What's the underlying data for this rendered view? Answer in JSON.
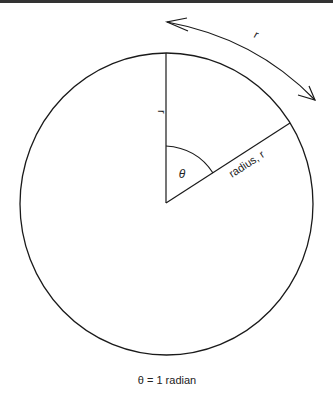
{
  "diagram": {
    "caption": "θ = 1 radian",
    "angle_label": "θ",
    "radius_label": "radius, r",
    "side_label": "r",
    "arc_label": "r",
    "colors": {
      "stroke": "#1a1a1a",
      "background": "#ffffff",
      "top_rule": "#333333"
    }
  }
}
